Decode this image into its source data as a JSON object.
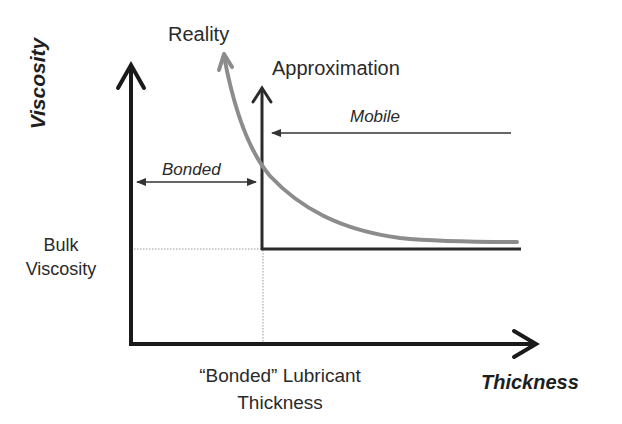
{
  "diagram": {
    "type": "conceptual-plot",
    "y_axis_label": "Viscosity",
    "x_axis_label": "Thickness",
    "curves": {
      "reality": {
        "label": "Reality",
        "color": "#8c8c8c"
      },
      "approximation": {
        "label": "Approximation",
        "color": "#2b2b2b"
      }
    },
    "regions": {
      "bonded": {
        "label": "Bonded"
      },
      "mobile": {
        "label": "Mobile"
      }
    },
    "reference_levels": {
      "bulk_viscosity": {
        "line1": "Bulk",
        "line2": "Viscosity"
      },
      "bonded_thickness": {
        "line1": "“Bonded” Lubricant",
        "line2": "Thickness"
      }
    },
    "colors": {
      "axis": "#1a1a1a",
      "approximation": "#2b2b2b",
      "reality": "#8c8c8c",
      "annotation": "#333333",
      "guide": "#9a9a9a"
    }
  }
}
